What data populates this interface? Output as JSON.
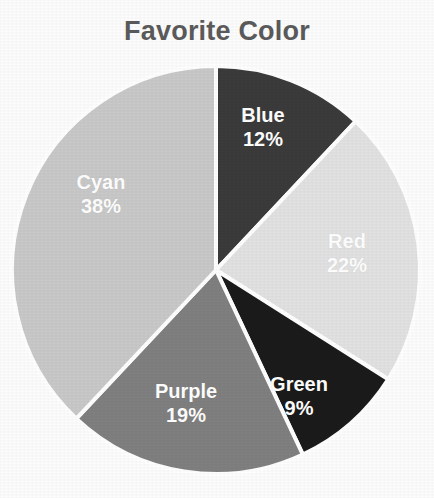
{
  "chart_data": {
    "type": "pie",
    "title": "Favorite Color",
    "xlabel": "",
    "ylabel": "",
    "legend": "none",
    "grid": false,
    "start_angle_deg": 0,
    "direction": "clockwise",
    "categories": [
      "Blue",
      "Red",
      "Green",
      "Purple",
      "Cyan"
    ],
    "values": [
      12,
      22,
      9,
      19,
      38
    ],
    "value_unit": "%",
    "slices": [
      {
        "label": "Blue",
        "percent": "12%",
        "value": 12,
        "color": "#3b3b3b",
        "label_x": 263,
        "label_y": 128
      },
      {
        "label": "Red",
        "percent": "22%",
        "value": 22,
        "color": "#e2e2e2",
        "label_x": 347,
        "label_y": 254
      },
      {
        "label": "Green",
        "percent": "9%",
        "value": 9,
        "color": "#1b1b1b",
        "label_x": 299,
        "label_y": 397
      },
      {
        "label": "Purple",
        "percent": "19%",
        "value": 19,
        "color": "#808080",
        "label_x": 186,
        "label_y": 404
      },
      {
        "label": "Cyan",
        "percent": "38%",
        "value": 38,
        "color": "#c9c9c9",
        "label_x": 101,
        "label_y": 195
      }
    ],
    "geometry": {
      "center_x": 216,
      "center_y": 270,
      "radius": 204,
      "separator_color": "#ffffff",
      "separator_width": 4
    },
    "colors": {
      "title": "#5b5b5b",
      "background": "#fdfdfd",
      "label_text": "#ffffff"
    }
  }
}
